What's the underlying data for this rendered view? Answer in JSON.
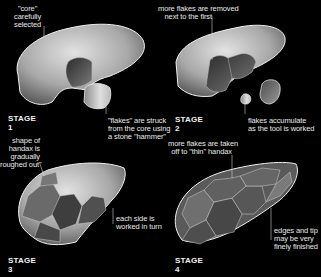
{
  "stages": [
    {
      "title": "STAGE 1",
      "labels": [
        {
          "id": "core",
          "lines": [
            "\"core\"",
            "carefully",
            "selected"
          ]
        },
        {
          "id": "flakes",
          "lines": [
            "\"flakes\" are struck",
            "from the core using",
            "a stone \"hammer\""
          ]
        }
      ]
    },
    {
      "title": "STAGE 2",
      "labels": [
        {
          "id": "more-flakes",
          "lines": [
            "more flakes are removed",
            "next to the first"
          ]
        },
        {
          "id": "accumulate",
          "lines": [
            "flakes accumulate",
            "as the tool is worked"
          ]
        }
      ]
    },
    {
      "title": "STAGE 3",
      "labels": [
        {
          "id": "roughed",
          "lines": [
            "shape of",
            "handax is",
            "gradually",
            "roughed out\""
          ]
        },
        {
          "id": "each-side",
          "lines": [
            "each side is",
            "worked in turn"
          ]
        }
      ]
    },
    {
      "title": "STAGE 4",
      "labels": [
        {
          "id": "thin",
          "lines": [
            "more flakes are taken",
            "off to \"thin\" handax"
          ]
        },
        {
          "id": "edges",
          "lines": [
            "edges and tip",
            "may be very",
            "finely finished"
          ]
        }
      ]
    }
  ],
  "colors": {
    "background": "#000000",
    "stone_light": "#d8d8d8",
    "stone_dark": "#4a4a4a",
    "outline": "#f0f0f0"
  }
}
